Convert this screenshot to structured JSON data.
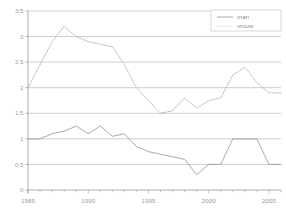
{
  "chart_data": {
    "type": "line",
    "title": "",
    "subtitle": "",
    "xlabel": "",
    "ylabel": "",
    "xlim": [
      1985,
      2006
    ],
    "ylim": [
      0,
      3.5
    ],
    "grid": true,
    "grid_axis": "y",
    "legend_position": "top-right",
    "y_ticks": [
      "3,5",
      "3",
      "2,5",
      "2",
      "1,5",
      "1",
      "0,5",
      "0"
    ],
    "y_tick_values": [
      3.5,
      3,
      2.5,
      2,
      1.5,
      1,
      0.5,
      0
    ],
    "x_ticks": [
      "1985",
      "1990",
      "1995",
      "2000",
      "2005"
    ],
    "x_tick_values": [
      1985,
      1990,
      1995,
      2000,
      2005
    ],
    "x_minor_step": 1,
    "x": [
      1985,
      1986,
      1987,
      1988,
      1989,
      1990,
      1991,
      1992,
      1993,
      1994,
      1995,
      1996,
      1997,
      1998,
      1999,
      2000,
      2001,
      2002,
      2003,
      2004,
      2005,
      2006
    ],
    "series": [
      {
        "name": "man",
        "style": "solid",
        "color": "#a0a0a0",
        "values": [
          1.0,
          1.0,
          1.1,
          1.15,
          1.25,
          1.1,
          1.25,
          1.05,
          1.1,
          0.85,
          0.75,
          0.7,
          0.65,
          0.6,
          0.3,
          0.5,
          0.5,
          1.0,
          1.0,
          1.0,
          0.5,
          0.5
        ]
      },
      {
        "name": "vrouw",
        "style": "dotted",
        "color": "#b4b4b4",
        "values": [
          2.0,
          2.45,
          2.9,
          3.2,
          3.0,
          2.9,
          2.85,
          2.8,
          2.45,
          2.0,
          1.75,
          1.5,
          1.55,
          1.8,
          1.6,
          1.75,
          1.8,
          2.25,
          2.4,
          2.1,
          1.9,
          1.9
        ]
      }
    ]
  },
  "legend": {
    "items": [
      {
        "label": "man",
        "style": "solid"
      },
      {
        "label": "vrouw",
        "style": "dotted"
      }
    ]
  }
}
